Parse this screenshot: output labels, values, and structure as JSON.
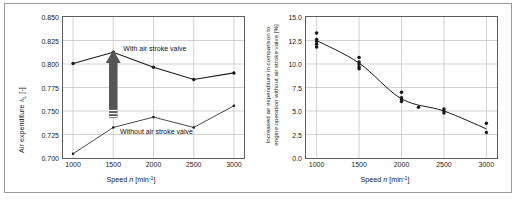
{
  "figure": {
    "background": "#ffffff",
    "frame_color": "#9a9a9a",
    "axis_color": "#5d5d5d",
    "grid_color": "#bfbfbf",
    "series_color": "#1a1a1a",
    "arrow_color": "#555555"
  },
  "chart_data": [
    {
      "id": "left",
      "type": "line",
      "title": "",
      "xlabel_main": "Speed",
      "xlabel_symbol": "n",
      "xlabel_units": "[min",
      "xlabel_units_exp": "-1",
      "xlabel_units_close": "]",
      "ylabel_main": "Air expenditure",
      "ylabel_symbol": "λ",
      "ylabel_sub": "L",
      "ylabel_units": "[-]",
      "x": [
        1000,
        1500,
        2000,
        2500,
        3000
      ],
      "xticklabels": [
        "1000",
        "1500",
        "2000",
        "2500",
        "3000"
      ],
      "xlim": [
        875,
        3125
      ],
      "ylim": [
        0.7,
        0.85
      ],
      "yticks": [
        0.85,
        0.825,
        0.8,
        0.775,
        0.75,
        0.725,
        0.7
      ],
      "yticklabels": [
        "0.850",
        "0.825",
        "0.800",
        "0.775",
        "0.750",
        "0.725",
        "0.700"
      ],
      "grid": true,
      "series": [
        {
          "name": "With air stroke valve",
          "label": "With air stroke valve",
          "values": [
            0.8005,
            0.8125,
            0.7965,
            0.7835,
            0.7905
          ]
        },
        {
          "name": "Without air stroke valve",
          "label": "Without air stroke valve",
          "values": [
            0.7045,
            0.7325,
            0.7435,
            0.7325,
            0.7555
          ]
        }
      ],
      "annotations": [
        {
          "kind": "arrow",
          "name": "improvement-arrow",
          "x": 1500,
          "y_from": 0.7425,
          "y_to": 0.8075
        }
      ]
    },
    {
      "id": "right",
      "type": "scatter",
      "title": "",
      "xlabel_main": "Speed",
      "xlabel_symbol": "n",
      "xlabel_units": "[min",
      "xlabel_units_exp": "-1",
      "xlabel_units_close": "]",
      "ylabel_line1": "Increased air expenditure in comparison to",
      "ylabel_line2": "engine operation without air stroke valve [%]",
      "xticklabels": [
        "1000",
        "1500",
        "2000",
        "2500",
        "3000"
      ],
      "xticks": [
        1000,
        1500,
        2000,
        2500,
        3000
      ],
      "xlim": [
        875,
        3125
      ],
      "ylim": [
        0,
        15
      ],
      "yticks": [
        15.0,
        12.5,
        10.0,
        7.5,
        5.0,
        2.5,
        0.0
      ],
      "yticklabels": [
        "15.0",
        "12.5",
        "10.0",
        "7.5",
        "5.0",
        "2.5",
        "0.0"
      ],
      "grid": true,
      "points": [
        {
          "x": 1000,
          "y": 13.3
        },
        {
          "x": 1000,
          "y": 12.6
        },
        {
          "x": 1000,
          "y": 12.4
        },
        {
          "x": 1000,
          "y": 12.1
        },
        {
          "x": 1000,
          "y": 11.8
        },
        {
          "x": 1500,
          "y": 10.7
        },
        {
          "x": 1500,
          "y": 10.2
        },
        {
          "x": 1500,
          "y": 10.0
        },
        {
          "x": 1500,
          "y": 9.7
        },
        {
          "x": 1500,
          "y": 9.5
        },
        {
          "x": 2000,
          "y": 7.0
        },
        {
          "x": 2000,
          "y": 6.4
        },
        {
          "x": 2000,
          "y": 6.2
        },
        {
          "x": 2000,
          "y": 6.0
        },
        {
          "x": 2200,
          "y": 5.4
        },
        {
          "x": 2500,
          "y": 5.2
        },
        {
          "x": 2500,
          "y": 5.0
        },
        {
          "x": 2500,
          "y": 4.8
        },
        {
          "x": 3000,
          "y": 3.7
        },
        {
          "x": 3000,
          "y": 2.7
        }
      ],
      "trend": [
        {
          "x": 1000,
          "y": 12.5
        },
        {
          "x": 1500,
          "y": 10.1
        },
        {
          "x": 2000,
          "y": 6.3
        },
        {
          "x": 2500,
          "y": 5.0
        },
        {
          "x": 3000,
          "y": 3.1
        }
      ]
    }
  ]
}
